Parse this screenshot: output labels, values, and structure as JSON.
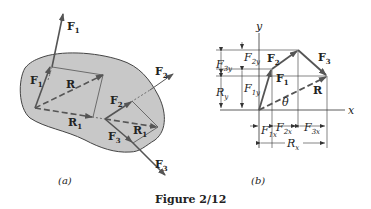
{
  "figure": {
    "caption": "Figure 2/12",
    "panels": [
      {
        "id": "a",
        "label": "(a)",
        "labels": {
          "F1_outer": "F",
          "F1_outer_sub": "1",
          "F1_inner": "F",
          "F1_inner_sub": "1",
          "R": "R",
          "R1_left": "R",
          "R1_left_sub": "1",
          "F2_outer": "F",
          "F2_outer_sub": "2",
          "F2_inner": "F",
          "F2_inner_sub": "2",
          "R1_right": "R",
          "R1_right_sub": "1",
          "F3_inner": "F",
          "F3_inner_sub": "3",
          "F3_outer": "F",
          "F3_outer_sub": "3"
        }
      },
      {
        "id": "b",
        "label": "(b)",
        "labels": {
          "y_axis": "y",
          "x_axis": "x",
          "F1": "F",
          "F1_sub": "1",
          "F2": "F",
          "F2_sub": "2",
          "F3": "F",
          "F3_sub": "3",
          "R": "R",
          "theta": "θ",
          "F2y": "F",
          "F2y_sub": "2y",
          "F3y": "F",
          "F3y_sub": "3y",
          "Ry": "R",
          "Ry_sub": "y",
          "F1y": "F",
          "F1y_sub": "1y",
          "F1x": "F",
          "F1x_sub": "1x",
          "F2x": "F",
          "F2x_sub": "2x",
          "F3x": "F",
          "F3x_sub": "3x",
          "Rx": "R",
          "Rx_sub": "x"
        }
      }
    ],
    "colors": {
      "body_fill": "#c8c8c8",
      "vector": "#555555",
      "line": "#333333"
    }
  }
}
